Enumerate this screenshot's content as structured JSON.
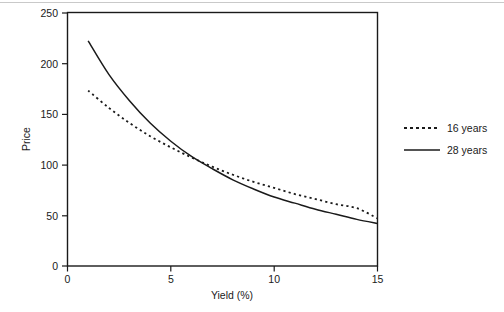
{
  "chart_data": {
    "type": "line",
    "title": "",
    "xlabel": "Yield (%)",
    "ylabel": "Price",
    "xlim": [
      0,
      15
    ],
    "ylim": [
      0,
      250
    ],
    "xticks": [
      0,
      5,
      10,
      15
    ],
    "yticks": [
      0,
      50,
      100,
      150,
      200,
      250
    ],
    "xtick_labels": [
      "0",
      "5",
      "10",
      "15"
    ],
    "ytick_labels": [
      "0",
      "50",
      "100",
      "150",
      "200",
      "250"
    ],
    "grid": false,
    "legend_position": "right",
    "x": [
      1,
      2,
      3,
      4,
      5,
      6,
      7,
      8,
      9,
      10,
      11,
      12,
      13,
      14,
      15
    ],
    "series": [
      {
        "name": "16 years",
        "style": "dashed",
        "color": "#1a1a1a",
        "values": [
          173,
          156,
          141,
          128,
          117,
          107,
          98,
          90,
          83,
          77,
          71,
          66,
          61,
          57,
          47
        ]
      },
      {
        "name": "28 years",
        "style": "solid",
        "color": "#1a1a1a",
        "values": [
          222,
          189,
          163,
          141,
          123,
          108,
          96,
          85,
          76,
          68,
          62,
          56,
          51,
          46,
          42
        ]
      }
    ]
  },
  "axes": {
    "y_title": "Price",
    "x_title": "Yield (%)"
  },
  "legend": {
    "entries": [
      {
        "label": "16 years",
        "style": "dashed"
      },
      {
        "label": "28 years",
        "style": "solid"
      }
    ]
  }
}
